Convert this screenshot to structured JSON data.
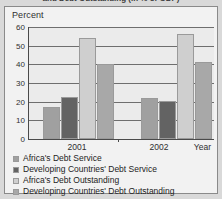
{
  "figure": {
    "title": "and Debt Outstanding (in % of GDP)",
    "percent_axis_label": "Percent"
  },
  "chart_data": {
    "type": "bar",
    "title": "and Debt Outstanding (in % of GDP)",
    "xlabel": "Year",
    "ylabel": "Percent",
    "ylim": [
      0,
      60
    ],
    "yticks": [
      0,
      10,
      20,
      30,
      40,
      50,
      60
    ],
    "grid": true,
    "legend_position": "below",
    "categories": [
      "2001",
      "2002"
    ],
    "series": [
      {
        "name": "Africa's Debt Service",
        "color": "#a0a0a0",
        "values": [
          17,
          0
        ]
      },
      {
        "name": "Developing Countries' Debt Service",
        "color": "#636363",
        "values": [
          22.5,
          22
        ]
      },
      {
        "name": "Africa's Debt Outstanding",
        "color": "#cfcfcf",
        "values": [
          54,
          20.5
        ]
      },
      {
        "name": "Developing Countries' Debt Outstanding",
        "color": "#a8a8a8",
        "values": [
          40,
          56.5
        ]
      }
    ],
    "extra_bars": [
      {
        "label": "2002 Africa's Debt Outstanding",
        "value": 56.5,
        "color": "#cfcfcf"
      },
      {
        "label": "2002 Developing Countries' Debt Outstanding",
        "value": 41,
        "color": "#a8a8a8"
      }
    ]
  },
  "bars": [
    {
      "name": "2001-africa-debt-service",
      "value": 17,
      "color": "#a0a0a0",
      "x": 14,
      "w": 17
    },
    {
      "name": "2001-developing-debt-service",
      "value": 22.5,
      "color": "#636363",
      "x": 32,
      "w": 17
    },
    {
      "name": "2001-africa-debt-outstanding",
      "value": 54,
      "color": "#cfcfcf",
      "x": 50,
      "w": 17
    },
    {
      "name": "2001-developing-debt-outstanding",
      "value": 40,
      "color": "#a8a8a8",
      "x": 68,
      "w": 17
    },
    {
      "name": "2002-africa-debt-service",
      "value": 0,
      "color": "#f4f4f4",
      "x": 94,
      "w": 17
    },
    {
      "name": "2002-developing-debt-service",
      "value": 22,
      "color": "#a0a0a0",
      "x": 112,
      "w": 17
    },
    {
      "name": "2002-africa-debt-outstanding",
      "value": 20.5,
      "color": "#636363",
      "x": 130,
      "w": 17
    },
    {
      "name": "2002-developing-debt-outstanding",
      "value": 56.5,
      "color": "#cfcfcf",
      "x": 148,
      "w": 17
    },
    {
      "name": "2002-year-debt-outstanding",
      "value": 41,
      "color": "#a8a8a8",
      "x": 166,
      "w": 17
    }
  ],
  "yticks": [
    {
      "label": "60",
      "value": 60
    },
    {
      "label": "50",
      "value": 50
    },
    {
      "label": "40",
      "value": 40
    },
    {
      "label": "30",
      "value": 30
    },
    {
      "label": "20",
      "value": 20
    },
    {
      "label": "10",
      "value": 10
    },
    {
      "label": "0",
      "value": 0
    }
  ],
  "xaxis": {
    "group_labels": [
      "2001",
      "2002"
    ],
    "axis_title": "Year"
  },
  "legend": {
    "items": [
      {
        "label": "Africa's Debt Service",
        "color": "#a0a0a0"
      },
      {
        "label": "Developing Countries' Debt Service",
        "color": "#636363"
      },
      {
        "label": "Africa's Debt Outstanding",
        "color": "#cfcfcf"
      },
      {
        "label": "Developing Countries' Debt Outstanding",
        "color": "#a8a8a8"
      }
    ]
  }
}
